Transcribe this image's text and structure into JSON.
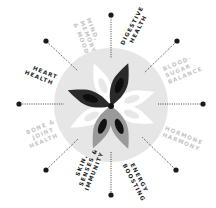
{
  "diagram": {
    "center": {
      "x": 111,
      "y": 105
    },
    "circle_radius": 57,
    "colors": {
      "circle_fill": "#e6e6e6",
      "dark_petal": "#2a2a2a",
      "gray_petal": "#9a9a9a",
      "white_petal": "#ffffff",
      "petal_inner_dark": "#111111",
      "dot": "#1a1a1a",
      "label_dark": "#1e1e1e",
      "label_light": "#c4c4c4"
    },
    "categories": [
      {
        "id": "mind",
        "line1": "MIND,",
        "line2": "MEMORY",
        "line3": "& MOOD",
        "emphasis": "light"
      },
      {
        "id": "digestive",
        "line1": "DIGESTIVE",
        "line2": "HEALTH",
        "line3": "",
        "emphasis": "dark"
      },
      {
        "id": "blood-sugar",
        "line1": "BLOOD-",
        "line2": "SUGAR",
        "line3": "BALANCE",
        "emphasis": "light"
      },
      {
        "id": "hormone",
        "line1": "HORMONE",
        "line2": "HARMONY",
        "line3": "",
        "emphasis": "light"
      },
      {
        "id": "energy",
        "line1": "ENERGY",
        "line2": "BOOSTING",
        "line3": "",
        "emphasis": "dark"
      },
      {
        "id": "skin",
        "line1": "SKIN,",
        "line2": "SENSES &",
        "line3": "IMMUNITY",
        "emphasis": "dark"
      },
      {
        "id": "bone",
        "line1": "BONE &",
        "line2": "JOINT",
        "line3": "HEALTH",
        "emphasis": "light"
      },
      {
        "id": "heart",
        "line1": "HEART",
        "line2": "HEALTH",
        "line3": "",
        "emphasis": "dark"
      }
    ]
  }
}
